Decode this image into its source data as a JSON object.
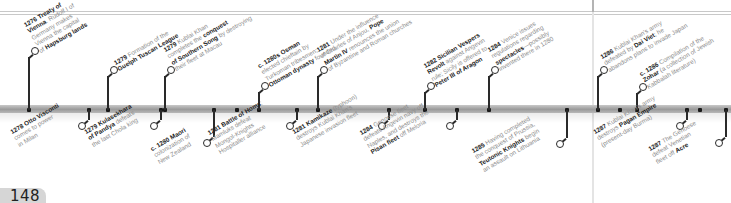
{
  "page": {
    "number": "148",
    "colors": {
      "background": "#ffffff",
      "timeline_bar": "#a8a8a8",
      "marker": "#222222",
      "label_text": "#8c8c8c",
      "label_bold": "#222222",
      "page_tab": "#d6d6d6"
    }
  },
  "timeline": {
    "above": [
      {
        "id": "e1276",
        "x": 29,
        "nodeY": 51,
        "lines": [
          [
            "1276 Treaty of ",
            ""
          ],
          [
            "Vienna",
            ". Rudolf I of"
          ],
          [
            "",
            "Germany makes"
          ],
          [
            "",
            "Vienna the capital"
          ],
          [
            "of ",
            "Hapsburg lands"
          ]
        ],
        "text": {
          "year": "1276",
          "parts": [
            {
              "b": "1276 Treaty of Vienna"
            },
            {
              "t": ". Rudolf I of Germany makes Vienna the capital of "
            },
            {
              "b": "Hapsburg lands"
            }
          ]
        }
      },
      {
        "id": "e1279a",
        "x": 108,
        "nodeY": 70,
        "text": {
          "year": "1279",
          "parts": [
            {
              "b": "1279"
            },
            {
              "t": " Formation of the "
            },
            {
              "b": "Guelph Tuscan League"
            }
          ]
        }
      },
      {
        "id": "e1279b",
        "x": 165,
        "nodeY": 70,
        "text": {
          "year": "1279",
          "parts": [
            {
              "b": "1279"
            },
            {
              "t": " Kublai Khan completes the "
            },
            {
              "b": "conquest of Southern Song"
            },
            {
              "t": " by destroying their fleet at Macau"
            }
          ]
        }
      },
      {
        "id": "e1280s",
        "x": 259,
        "nodeY": 86,
        "text": {
          "year": "c. 1280s",
          "parts": [
            {
              "b": "c. 1280s Osman"
            },
            {
              "t": " elected chieftain by Turkoman tribesmen; "
            },
            {
              "b": "Ottoman dynasty"
            },
            {
              "t": " founded"
            }
          ]
        }
      },
      {
        "id": "e1281a",
        "x": 318,
        "nodeY": 70,
        "text": {
          "year": "1281",
          "parts": [
            {
              "b": "1281"
            },
            {
              "t": " Under the influence of Charles of Anjou, "
            },
            {
              "b": "Pope Martin IV"
            },
            {
              "t": " renounces the union of Byzantine and Roman churches"
            }
          ]
        }
      },
      {
        "id": "e1282",
        "x": 425,
        "nodeY": 86,
        "text": {
          "year": "1282",
          "parts": [
            {
              "b": "1282 Sicilian Vespers Revolt"
            },
            {
              "t": " against Angevin rule; Sicily is offered to "
            },
            {
              "b": "Peter III of Aragon"
            }
          ]
        }
      },
      {
        "id": "e1284a",
        "x": 489,
        "nodeY": 70,
        "text": {
          "year": "1284",
          "parts": [
            {
              "b": "1284"
            },
            {
              "t": " Venice issues regulations regarding "
            },
            {
              "b": "spectacles"
            },
            {
              "t": "—possibly invented there in 1280"
            }
          ]
        }
      },
      {
        "id": "e1286a",
        "x": 598,
        "nodeY": 70,
        "text": {
          "year": "1286",
          "parts": [
            {
              "b": "1286"
            },
            {
              "t": " Kublai Khan's army defeated by "
            },
            {
              "b": "Dai Viet"
            },
            {
              "t": "; he abandons plans to invade Japan"
            }
          ]
        }
      },
      {
        "id": "e1286b",
        "x": 637,
        "nodeY": 87,
        "text": {
          "year": "c. 1286",
          "parts": [
            {
              "b": "c. 1286"
            },
            {
              "t": " Compilation of the "
            },
            {
              "b": "Zohar"
            },
            {
              "t": " (a collection of Jewish Kabbalah literature)"
            }
          ]
        }
      }
    ],
    "below": [
      {
        "id": "e1278",
        "x": 89,
        "nodeY": 124,
        "text": {
          "year": "1278",
          "parts": [
            {
              "b": "1278 Otto Visconti"
            },
            {
              "t": " comes to power in Milan"
            }
          ]
        }
      },
      {
        "id": "e1279c",
        "x": 161,
        "nodeY": 124,
        "text": {
          "year": "1279",
          "parts": [
            {
              "b": "1279 Kulasekhara of Pandya"
            },
            {
              "t": " defeats the last Chola king"
            }
          ]
        }
      },
      {
        "id": "e1280",
        "x": 214,
        "nodeY": 141,
        "text": {
          "year": "c. 1280",
          "parts": [
            {
              "b": "c. 1280 Maori"
            },
            {
              "t": " colonization of New Zealand"
            }
          ]
        }
      },
      {
        "id": "e1281b",
        "x": 297,
        "nodeY": 124,
        "text": {
          "year": "1281",
          "parts": [
            {
              "b": "1281 Battle of Homs"
            },
            {
              "t": ": Mamluks defeat Mongol-Knights Hospitaller alliance"
            }
          ]
        }
      },
      {
        "id": "e1281c",
        "x": 389,
        "nodeY": 124,
        "text": {
          "year": "1281",
          "parts": [
            {
              "b": "1281 Kamikaze"
            },
            {
              "t": " (typhoon) destroys Kublai Khan's Japanese invasion fleet"
            }
          ]
        }
      },
      {
        "id": "e1284b",
        "x": 457,
        "nodeY": 124,
        "text": {
          "year": "1284",
          "parts": [
            {
              "b": "1284"
            },
            {
              "t": " Genoese fleet defeats Angevin navy off Naples, and destroys the "
            },
            {
              "b": "Pisan fleet"
            },
            {
              "t": " off Meloria"
            }
          ]
        }
      },
      {
        "id": "e1285",
        "x": 567,
        "nodeY": 142,
        "text": {
          "year": "1285",
          "parts": [
            {
              "b": "1285"
            },
            {
              "t": " Having completed the conquest of Prussia, "
            },
            {
              "b": "Teutonic Knights"
            },
            {
              "t": " begin an assault on Lithuania"
            }
          ]
        }
      },
      {
        "id": "e1287a",
        "x": 687,
        "nodeY": 124,
        "text": {
          "year": "1287",
          "parts": [
            {
              "b": "1287"
            },
            {
              "t": " Kublai Khan's army destroys "
            },
            {
              "b": "Pagan Empire"
            },
            {
              "t": " (present-day Burma)"
            }
          ]
        }
      },
      {
        "id": "e1287b",
        "x": 726,
        "nodeY": 141,
        "text": {
          "year": "1287",
          "parts": [
            {
              "b": "1287"
            },
            {
              "t": " The Genoese defeat Venetian fleet off "
            },
            {
              "b": "Acre"
            }
          ]
        }
      }
    ],
    "labels_above": [
      [
        "<b>1276 Treaty of</b>",
        "<b>Vienna</b>. Rudolf I of",
        "Germany makes",
        "Vienna the capital",
        "of <b>Hapsburg lands</b>"
      ],
      [
        "<b>1279</b> Formation of the",
        "<b>Guelph Tuscan League</b>"
      ],
      [
        "<b>1279</b> Kublai Khan",
        "completes the <b>conquest</b>",
        "<b>of Southern Song</b> by destroying",
        "their fleet at Macau"
      ],
      [
        "<b>c. 1280s Osman</b>",
        "elected chieftain by",
        "Turkoman tribesmen;",
        "<b>Ottoman dynasty</b> founded"
      ],
      [
        "<b>1281</b> Under the influence",
        "of Charles of Anjou, <b>Pope</b>",
        "<b>Martin IV</b> renounces the union",
        "of Byzantine and Roman churches"
      ],
      [
        "<b>1282 Sicilian Vespers</b>",
        "<b>Revolt</b> against Angevin",
        "rule; Sicily is offered to",
        "<b>Peter III of Aragon</b>"
      ],
      [
        "<b>1284</b> Venice issues",
        "regulations regarding",
        "<b>spectacles</b>—possibly",
        "invented there in 1280"
      ],
      [
        "<b>1286</b> Kublai Khan's army",
        "defeated by <b>Dai Viet</b>; he",
        "abandons plans to invade Japan"
      ],
      [
        "<b>c. 1286</b> Compilation of the",
        "<b>Zohar</b> (a collection of Jewish",
        "Kabbalah literature)"
      ]
    ],
    "labels_below": [
      [
        "<b>1278 Otto Visconti</b>",
        "comes to power",
        "in Milan"
      ],
      [
        "<b>1279 Kulasekhara</b>",
        "<b>of Pandya</b> defeats",
        "the last Chola king"
      ],
      [
        "<b>c. 1280 Maori</b>",
        "colonization of",
        "New Zealand"
      ],
      [
        "<b>1281 Battle of Homs</b>:",
        "Mamluks defeat",
        "Mongol-Knights",
        "Hospitaller alliance"
      ],
      [
        "<b>1281 Kamikaze</b> (typhoon)",
        "destroys Kublai Khan's",
        "Japanese invasion fleet"
      ],
      [
        "<b>1284</b> Genoese fleet",
        "defeats Angevin navy off",
        "Naples, and destroys the",
        "<b>Pisan fleet</b> off Meloria"
      ],
      [
        "<b>1285</b> Having completed",
        "the conquest of Prussia,",
        "<b>Teutonic Knights</b> begin",
        "an assault on Lithuania"
      ],
      [
        "<b>1287</b> Kublai Khan's army",
        "destroys <b>Pagan Empire</b>",
        "(present-day Burma)"
      ],
      [
        "<b>1287</b> The Genoese",
        "defeat Venetian",
        "fleet off <b>Acre</b>"
      ]
    ],
    "extra_ticks": [
      237,
      620,
      700
    ]
  }
}
